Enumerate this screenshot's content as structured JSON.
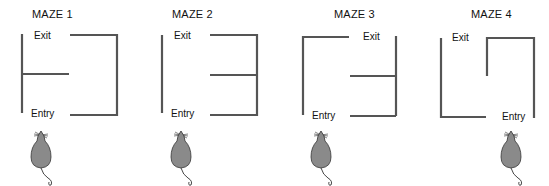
{
  "mazes": [
    {
      "title": "MAZE 1",
      "exit_label": "Exit",
      "entry_label": "Entry"
    },
    {
      "title": "MAZE 2",
      "exit_label": "Exit",
      "entry_label": "Entry"
    },
    {
      "title": "MAZE 3",
      "exit_label": "Exit",
      "entry_label": "Entry"
    },
    {
      "title": "MAZE 4",
      "exit_label": "Exit",
      "entry_label": "Entry"
    }
  ],
  "colors": {
    "wall": "#555555",
    "mouse_body": "#8a8a8a",
    "mouse_outline": "#333333"
  }
}
